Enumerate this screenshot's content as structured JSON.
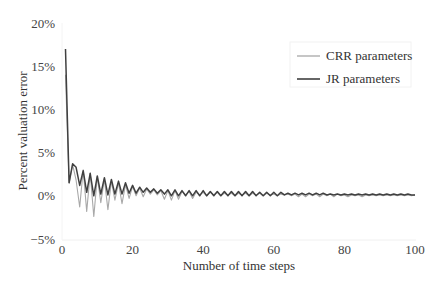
{
  "chart_data": {
    "type": "line",
    "title": "",
    "xlabel": "Number of time steps",
    "ylabel": "Percent valuation error",
    "xlim": [
      0,
      100
    ],
    "ylim": [
      -5,
      20
    ],
    "x_ticks": [
      0,
      20,
      40,
      60,
      80,
      100
    ],
    "x_tick_labels": [
      "0",
      "20",
      "40",
      "60",
      "80",
      "100"
    ],
    "y_ticks": [
      -5,
      0,
      5,
      10,
      15,
      20
    ],
    "y_tick_labels": [
      "−5%",
      "0%",
      "5%",
      "10%",
      "15%",
      "20%"
    ],
    "grid": false,
    "legend_position": "upper right",
    "series": [
      {
        "name": "CRR parameters",
        "color": "#a8a8a8",
        "x": [
          1,
          2,
          3,
          4,
          5,
          6,
          7,
          8,
          9,
          10,
          11,
          12,
          13,
          14,
          15,
          16,
          17,
          18,
          19,
          20,
          21,
          22,
          23,
          24,
          25,
          26,
          27,
          28,
          29,
          30,
          31,
          32,
          33,
          34,
          35,
          36,
          37,
          38,
          39,
          40,
          41,
          42,
          43,
          44,
          45,
          46,
          47,
          48,
          49,
          50,
          51,
          52,
          53,
          54,
          55,
          56,
          57,
          58,
          59,
          60,
          61,
          62,
          63,
          64,
          65,
          66,
          67,
          68,
          69,
          70,
          71,
          72,
          73,
          74,
          75,
          76,
          77,
          78,
          79,
          80,
          81,
          82,
          83,
          84,
          85,
          86,
          87,
          88,
          89,
          90,
          91,
          92,
          93,
          94,
          95,
          96,
          97,
          98,
          99,
          100
        ],
        "values": [
          14.0,
          1.5,
          3.6,
          1.8,
          -1.3,
          3.0,
          -1.8,
          2.6,
          -2.4,
          2.2,
          -0.8,
          1.9,
          -1.6,
          1.7,
          -0.5,
          1.5,
          -0.9,
          1.3,
          -0.3,
          1.1,
          0.0,
          0.9,
          -0.1,
          0.8,
          0.2,
          0.7,
          0.1,
          0.6,
          -0.4,
          0.6,
          -0.5,
          0.6,
          -0.4,
          0.5,
          0.1,
          0.5,
          -0.3,
          0.4,
          0.1,
          0.4,
          0.0,
          0.4,
          0.1,
          0.4,
          0.0,
          0.3,
          0.1,
          0.3,
          0.0,
          0.3,
          0.1,
          0.3,
          0.0,
          0.3,
          0.1,
          0.3,
          0.0,
          0.3,
          0.1,
          0.2,
          0.0,
          0.2,
          0.1,
          0.2,
          0.0,
          0.2,
          -0.1,
          0.2,
          -0.1,
          0.2,
          0.0,
          0.2,
          -0.1,
          0.2,
          0.0,
          0.2,
          -0.1,
          0.2,
          0.0,
          0.1,
          -0.1,
          0.1,
          0.0,
          0.1,
          -0.1,
          0.1,
          0.0,
          0.1,
          0.0,
          0.1,
          0.0,
          0.1,
          0.0,
          0.1,
          0.0,
          0.1,
          0.0,
          0.1,
          0.0,
          0.1
        ]
      },
      {
        "name": "JR parameters",
        "color": "#404040",
        "x": [
          1,
          2,
          3,
          4,
          5,
          6,
          7,
          8,
          9,
          10,
          11,
          12,
          13,
          14,
          15,
          16,
          17,
          18,
          19,
          20,
          21,
          22,
          23,
          24,
          25,
          26,
          27,
          28,
          29,
          30,
          31,
          32,
          33,
          34,
          35,
          36,
          37,
          38,
          39,
          40,
          41,
          42,
          43,
          44,
          45,
          46,
          47,
          48,
          49,
          50,
          51,
          52,
          53,
          54,
          55,
          56,
          57,
          58,
          59,
          60,
          61,
          62,
          63,
          64,
          65,
          66,
          67,
          68,
          69,
          70,
          71,
          72,
          73,
          74,
          75,
          76,
          77,
          78,
          79,
          80,
          81,
          82,
          83,
          84,
          85,
          86,
          87,
          88,
          89,
          90,
          91,
          92,
          93,
          94,
          95,
          96,
          97,
          98,
          99,
          100
        ],
        "values": [
          17.0,
          1.5,
          3.7,
          3.3,
          1.2,
          2.9,
          0.4,
          2.6,
          0.0,
          2.3,
          0.2,
          2.1,
          0.1,
          1.9,
          0.2,
          1.7,
          0.2,
          1.5,
          0.3,
          1.2,
          0.3,
          1.0,
          0.4,
          0.9,
          0.4,
          0.8,
          0.3,
          0.7,
          0.2,
          0.7,
          0.0,
          0.7,
          0.0,
          0.6,
          0.0,
          0.6,
          0.0,
          0.6,
          0.0,
          0.6,
          0.0,
          0.5,
          0.0,
          0.5,
          0.0,
          0.5,
          0.0,
          0.5,
          0.0,
          0.5,
          0.0,
          0.5,
          0.0,
          0.5,
          0.0,
          0.4,
          0.0,
          0.4,
          0.0,
          0.4,
          0.0,
          0.4,
          0.1,
          0.3,
          0.1,
          0.3,
          0.1,
          0.3,
          0.1,
          0.3,
          0.1,
          0.3,
          0.1,
          0.3,
          0.1,
          0.2,
          0.1,
          0.2,
          0.1,
          0.2,
          0.1,
          0.2,
          0.1,
          0.2,
          0.1,
          0.2,
          0.1,
          0.2,
          0.1,
          0.2,
          0.1,
          0.2,
          0.1,
          0.2,
          0.1,
          0.2,
          0.1,
          0.2,
          0.1,
          0.1
        ]
      }
    ]
  }
}
